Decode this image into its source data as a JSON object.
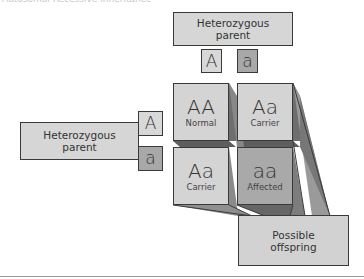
{
  "title": "Autosomal Recessive Inheritance",
  "top_parent": {
    "label_line1": "Heterozygous",
    "label_line2": "parent",
    "alleles": [
      "A",
      "a"
    ]
  },
  "left_parent": {
    "label_line1": "Heterozygous",
    "label_line2": "parent",
    "alleles": [
      "A",
      "a"
    ]
  },
  "punnett": {
    "cells": [
      {
        "genotype": "AA",
        "phenotype": "Normal"
      },
      {
        "genotype": "Aa",
        "phenotype": "Carrier"
      },
      {
        "genotype": "Aa",
        "phenotype": "Carrier"
      },
      {
        "genotype": "aa",
        "phenotype": "Affected"
      }
    ]
  },
  "offspring": {
    "label_line1": "Possible",
    "label_line2": "offspring"
  },
  "colors": {
    "light_fill": "#d6d6d6",
    "dark_fill": "#a9a9a9",
    "shadow": "#7a7a7a",
    "border": "#3a3a3a"
  }
}
